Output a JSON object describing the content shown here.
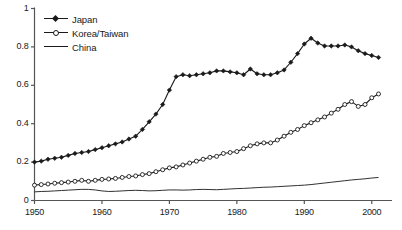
{
  "chart_data": {
    "type": "line",
    "title": "",
    "subtitle": "",
    "xlabel": "",
    "ylabel": "",
    "xlim": [
      1950,
      2003
    ],
    "ylim": [
      0,
      1
    ],
    "grid": false,
    "legend_position": "top-left",
    "x_ticks": [
      "1950",
      "1960",
      "1970",
      "1980",
      "1990",
      "2000"
    ],
    "x_tick_values": [
      1950,
      1960,
      1970,
      1980,
      1990,
      2000
    ],
    "y_ticks": [
      "0",
      "0.2",
      "0.4",
      "0.6",
      "0.8",
      "1"
    ],
    "y_tick_values": [
      0,
      0.2,
      0.4,
      0.6,
      0.8,
      1
    ],
    "x": [
      1950,
      1951,
      1952,
      1953,
      1954,
      1955,
      1956,
      1957,
      1958,
      1959,
      1960,
      1961,
      1962,
      1963,
      1964,
      1965,
      1966,
      1967,
      1968,
      1969,
      1970,
      1971,
      1972,
      1973,
      1974,
      1975,
      1976,
      1977,
      1978,
      1979,
      1980,
      1981,
      1982,
      1983,
      1984,
      1985,
      1986,
      1987,
      1988,
      1989,
      1990,
      1991,
      1992,
      1993,
      1994,
      1995,
      1996,
      1997,
      1998,
      1999,
      2000,
      2001
    ],
    "series": [
      {
        "name": "Japan",
        "marker": "filled-diamond",
        "values": [
          0.2,
          0.205,
          0.215,
          0.22,
          0.225,
          0.235,
          0.245,
          0.25,
          0.255,
          0.265,
          0.275,
          0.285,
          0.295,
          0.305,
          0.32,
          0.335,
          0.37,
          0.41,
          0.45,
          0.5,
          0.575,
          0.645,
          0.655,
          0.65,
          0.655,
          0.66,
          0.665,
          0.675,
          0.675,
          0.67,
          0.665,
          0.655,
          0.685,
          0.66,
          0.655,
          0.655,
          0.665,
          0.68,
          0.72,
          0.765,
          0.815,
          0.845,
          0.82,
          0.805,
          0.805,
          0.805,
          0.81,
          0.8,
          0.78,
          0.765,
          0.755,
          0.745
        ]
      },
      {
        "name": "Korea/Taiwan",
        "marker": "open-circle",
        "values": [
          0.08,
          0.083,
          0.086,
          0.09,
          0.093,
          0.096,
          0.1,
          0.105,
          0.1,
          0.105,
          0.11,
          0.112,
          0.115,
          0.12,
          0.125,
          0.128,
          0.135,
          0.14,
          0.15,
          0.16,
          0.17,
          0.175,
          0.185,
          0.195,
          0.205,
          0.215,
          0.225,
          0.23,
          0.245,
          0.25,
          0.255,
          0.27,
          0.285,
          0.295,
          0.3,
          0.3,
          0.315,
          0.335,
          0.355,
          0.37,
          0.39,
          0.405,
          0.42,
          0.435,
          0.455,
          0.475,
          0.5,
          0.515,
          0.49,
          0.5,
          0.535,
          0.555
        ]
      },
      {
        "name": "China",
        "marker": "none",
        "values": [
          0.045,
          0.047,
          0.048,
          0.05,
          0.052,
          0.054,
          0.056,
          0.058,
          0.058,
          0.055,
          0.05,
          0.047,
          0.048,
          0.05,
          0.052,
          0.053,
          0.052,
          0.05,
          0.051,
          0.053,
          0.055,
          0.055,
          0.054,
          0.055,
          0.057,
          0.058,
          0.057,
          0.056,
          0.058,
          0.06,
          0.062,
          0.063,
          0.065,
          0.067,
          0.069,
          0.07,
          0.072,
          0.074,
          0.076,
          0.078,
          0.08,
          0.083,
          0.087,
          0.091,
          0.095,
          0.099,
          0.103,
          0.107,
          0.11,
          0.113,
          0.117,
          0.12
        ]
      }
    ]
  },
  "axis_color": "#555555",
  "line_color": "#1a1a1a",
  "background": "#ffffff"
}
